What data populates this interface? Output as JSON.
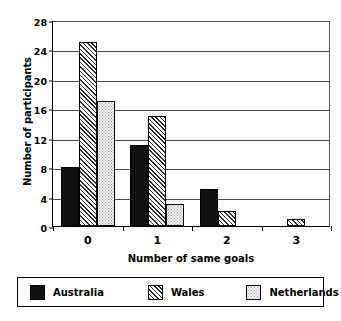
{
  "chart_data": {
    "type": "bar",
    "title": "",
    "xlabel": "Number of same goals",
    "ylabel": "Number of participants",
    "categories": [
      "0",
      "1",
      "2",
      "3"
    ],
    "series": [
      {
        "name": "Australia",
        "values": [
          8,
          11,
          5,
          0
        ],
        "fill": "solid-black",
        "color": "#111111"
      },
      {
        "name": "Wales",
        "values": [
          25,
          15,
          2,
          1
        ],
        "fill": "diagonal-hatch",
        "color": "#2b2b2b"
      },
      {
        "name": "Netherlands",
        "values": [
          17,
          3,
          0,
          0
        ],
        "fill": "dotted-light",
        "color": "#f2f2f2"
      }
    ],
    "ylim": [
      0,
      28
    ],
    "yticks": [
      0,
      4,
      8,
      12,
      16,
      20,
      24,
      28
    ],
    "ytick_labels": [
      "0",
      "4",
      "8",
      "12",
      "16",
      "20",
      "24",
      "28"
    ],
    "grid": true,
    "grid_axis": "y",
    "legend_position": "bottom",
    "background": "#ffffff",
    "frame_color": "#000000"
  },
  "legend": {
    "entries": [
      {
        "label": "Australia"
      },
      {
        "label": "Wales"
      },
      {
        "label": "Netherlands"
      }
    ]
  }
}
